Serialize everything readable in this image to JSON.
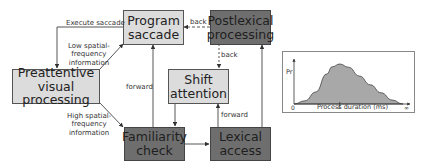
{
  "diagram": {
    "title": "",
    "nodes": [
      {
        "id": "program_saccade",
        "label": "Program saccade",
        "line1": "Program",
        "line2": "saccade",
        "shade": "light"
      },
      {
        "id": "postlexical_processing",
        "label": "Postlexical processing",
        "line1": "Postlexical",
        "line2": "processing",
        "shade": "dark"
      },
      {
        "id": "preattentive_visual_processing",
        "label": "Preattentive visual processing",
        "line1": "Preattentive",
        "line2": "visual processing",
        "shade": "light"
      },
      {
        "id": "shift_attention",
        "label": "Shift attention",
        "line1": "Shift",
        "line2": "attention",
        "shade": "light"
      },
      {
        "id": "familiarity_check",
        "label": "Familiarity check",
        "line1": "Familiarity",
        "line2": "check",
        "shade": "dark"
      },
      {
        "id": "lexical_access",
        "label": "Lexical access",
        "line1": "Lexical",
        "line2": "access",
        "shade": "dark"
      }
    ],
    "edges": [
      {
        "from": "program_saccade",
        "to": "preattentive_visual_processing",
        "label": "Execute saccade",
        "style": "solid"
      },
      {
        "from": "preattentive_visual_processing",
        "to": "program_saccade",
        "label": "Low spatial-frequency information",
        "style": "solid"
      },
      {
        "from": "preattentive_visual_processing",
        "to": "familiarity_check",
        "label": "High spatial-frequency information",
        "style": "solid"
      },
      {
        "from": "familiarity_check",
        "to": "program_saccade",
        "label": "forward",
        "style": "solid"
      },
      {
        "from": "shift_attention",
        "to": "familiarity_check",
        "label": "",
        "style": "solid"
      },
      {
        "from": "familiarity_check",
        "to": "lexical_access",
        "label": "",
        "style": "solid"
      },
      {
        "from": "lexical_access",
        "to": "shift_attention",
        "label": "forward",
        "style": "solid"
      },
      {
        "from": "lexical_access",
        "to": "postlexical_processing",
        "label": "",
        "style": "solid"
      },
      {
        "from": "postlexical_processing",
        "to": "program_saccade",
        "label": "back",
        "style": "dashed"
      },
      {
        "from": "postlexical_processing",
        "to": "shift_attention",
        "label": "back",
        "style": "dashed"
      }
    ],
    "labels": {
      "execute_saccade": "Execute saccade",
      "low_sf_1": "Low spatial-",
      "low_sf_2": "frequency",
      "low_sf_3": "information",
      "high_sf_1": "High spatial-",
      "high_sf_2": "frequency",
      "high_sf_3": "information",
      "forward_left": "forward",
      "forward_right": "forward",
      "back_top": "back",
      "back_right": "back"
    },
    "colors": {
      "light_box": "#dcdcdc",
      "dark_box": "#6e6e6e",
      "line": "#444444",
      "curve_fill": "#a8a8a8"
    }
  },
  "chart_data": {
    "type": "area",
    "title": "",
    "xlabel": "Process duration (ms)",
    "ylabel": "Pr",
    "x_ticks": [
      "0",
      "t",
      "∞"
    ],
    "x": [
      0,
      0.1,
      0.2,
      0.3,
      0.35,
      0.42,
      0.5,
      0.6,
      0.7,
      0.8,
      0.9,
      1.0
    ],
    "values": [
      0,
      0.08,
      0.3,
      0.75,
      0.93,
      1.0,
      0.92,
      0.7,
      0.48,
      0.28,
      0.1,
      0
    ],
    "marker": {
      "label": "t",
      "x": 0.42
    },
    "grid": false,
    "legend": false
  }
}
